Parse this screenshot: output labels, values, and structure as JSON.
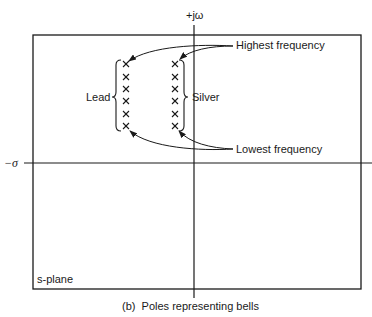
{
  "diagram": {
    "axes": {
      "vertical_label": "+jω",
      "horizontal_label": "−σ"
    },
    "plane_label": "s-plane",
    "groups": [
      {
        "label": "Lead",
        "pole_count": 6
      },
      {
        "label": "Silver",
        "pole_count": 6
      }
    ],
    "annotations": {
      "highest": "Highest frequency",
      "lowest": "Lowest frequency"
    },
    "caption": "(b)  Poles representing bells",
    "pole_symbol": "×",
    "colors": {
      "ink": "#1a1a1a",
      "background": "#ffffff"
    }
  }
}
